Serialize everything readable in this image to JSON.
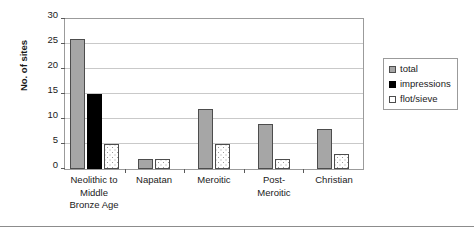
{
  "chart_data": {
    "type": "bar",
    "title": "",
    "xlabel": "",
    "ylabel": "No. of sites",
    "ylim": [
      0,
      30
    ],
    "ytick_step": 5,
    "yticks": [
      0,
      5,
      10,
      15,
      20,
      25,
      30
    ],
    "grid": true,
    "legend_position": "right",
    "categories": [
      "Neolithic to Middle Bronze Age",
      "Napatan",
      "Meroitic",
      "Post-Meroitic",
      "Christian"
    ],
    "category_label_lines": [
      [
        "Neolithic to",
        "Middle",
        "Bronze Age"
      ],
      [
        "Napatan"
      ],
      [
        "Meroitic"
      ],
      [
        "Post-",
        "Meroitic"
      ],
      [
        "Christian"
      ]
    ],
    "series": [
      {
        "name": "total",
        "color": "#a6a6a6",
        "values": [
          26,
          2,
          12,
          9,
          8
        ]
      },
      {
        "name": "impressions",
        "color": "#000000",
        "values": [
          15,
          0,
          0,
          0,
          0
        ]
      },
      {
        "name": "flot/sieve",
        "color": "#ffffff",
        "values": [
          5,
          2,
          5,
          2,
          3
        ]
      }
    ]
  },
  "legend": {
    "items": [
      {
        "label": "total"
      },
      {
        "label": "impressions"
      },
      {
        "label": "flot/sieve"
      }
    ]
  },
  "axis": {
    "y_title": "No. of sites",
    "y_tick_labels": [
      "30",
      "25",
      "20",
      "15",
      "10",
      "5",
      "0"
    ]
  }
}
